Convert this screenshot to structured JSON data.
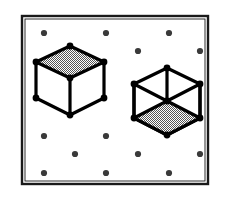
{
  "figure": {
    "caption": "",
    "background_color": "#ffffff",
    "ink_color": "#000000",
    "shade_color": "#9a9a9a",
    "frame": {
      "name": "outer-frame",
      "x": 22,
      "y": 16,
      "width": 186,
      "height": 168,
      "outer_stroke_width": 2.4,
      "inner_stroke_width": 0.9,
      "inner_inset": 3,
      "stroke_color": "#1a1a1a",
      "fill": "#ffffff"
    },
    "lattice": {
      "name": "dot-lattice",
      "dot_radius": 3.1,
      "dot_color": "#3a3a3a",
      "dot_count": 17,
      "description": "staggered rows of small filled dots",
      "dots": [
        {
          "x": 44,
          "y": 33
        },
        {
          "x": 106,
          "y": 33
        },
        {
          "x": 169,
          "y": 33
        },
        {
          "x": 138,
          "y": 51
        },
        {
          "x": 200,
          "y": 51
        },
        {
          "x": 44,
          "y": 136
        },
        {
          "x": 106,
          "y": 136
        },
        {
          "x": 75,
          "y": 154
        },
        {
          "x": 138,
          "y": 154
        },
        {
          "x": 200,
          "y": 154
        },
        {
          "x": 44,
          "y": 173
        },
        {
          "x": 106,
          "y": 173
        },
        {
          "x": 169,
          "y": 173
        }
      ]
    },
    "cubes": [
      {
        "name": "cube-left",
        "label": "left-cube-top-shaded",
        "shaded_face": "top",
        "center_x": 70,
        "center_y": 84,
        "half_width": 34,
        "top_rise": 13,
        "side_height": 32,
        "edge_stroke_width": 3.2,
        "vertex_radius": 3.4,
        "vertices": [
          {
            "name": "top-back",
            "x": 70,
            "y": 46
          },
          {
            "name": "top-left",
            "x": 36,
            "y": 62
          },
          {
            "name": "top-right",
            "x": 104,
            "y": 62
          },
          {
            "name": "top-front",
            "x": 70,
            "y": 78
          },
          {
            "name": "bot-left",
            "x": 36,
            "y": 98
          },
          {
            "name": "bot-right",
            "x": 104,
            "y": 98
          },
          {
            "name": "bot-front",
            "x": 70,
            "y": 115
          }
        ]
      },
      {
        "name": "cube-right",
        "label": "right-cube-bottom-shaded",
        "shaded_face": "bottom",
        "center_x": 167,
        "center_y": 102,
        "half_width": 33,
        "top_rise": 13,
        "side_height": 32,
        "edge_stroke_width": 3.2,
        "vertex_radius": 3.4,
        "vertices": [
          {
            "name": "top-front",
            "x": 167,
            "y": 68
          },
          {
            "name": "top-left",
            "x": 134,
            "y": 84
          },
          {
            "name": "top-right",
            "x": 200,
            "y": 84
          },
          {
            "name": "mid-center",
            "x": 167,
            "y": 101
          },
          {
            "name": "bot-left",
            "x": 134,
            "y": 118
          },
          {
            "name": "bot-right",
            "x": 200,
            "y": 118
          },
          {
            "name": "bot-front",
            "x": 167,
            "y": 135
          }
        ]
      }
    ]
  }
}
